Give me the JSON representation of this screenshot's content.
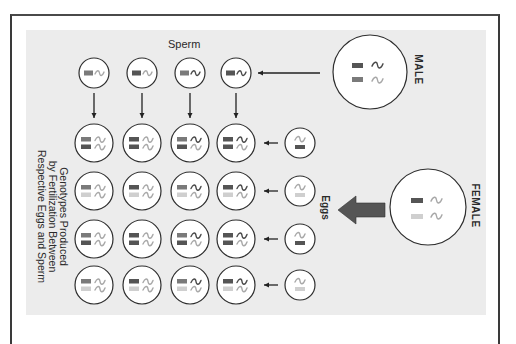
{
  "labels": {
    "sperm": "Sperm",
    "male": "MALE",
    "female": "FEMALE",
    "eggs": "Eggs",
    "genotypes_line1": "Genotypes Produced",
    "genotypes_line2": "by Fertilization Between",
    "genotypes_line3": "Respective Eggs and Sperm"
  },
  "colors": {
    "dark_bar": "#555555",
    "mid_bar": "#7a7a7a",
    "light_bar": "#cfcfcf",
    "dark_squiggle": "#4a4a4a",
    "light_squiggle": "#a8a8a8",
    "panel_bg": "#ececec",
    "arrow_fill": "#555555"
  },
  "male": {
    "bars": [
      "dark",
      "mid"
    ],
    "squiggles": [
      "dark",
      "light"
    ]
  },
  "female": {
    "bars": [
      "dark",
      "light"
    ],
    "squiggles": [
      "light",
      "light"
    ]
  },
  "sperm": [
    {
      "bar": "mid",
      "squiggle": "light"
    },
    {
      "bar": "dark",
      "squiggle": "light"
    },
    {
      "bar": "mid",
      "squiggle": "dark"
    },
    {
      "bar": "dark",
      "squiggle": "dark"
    }
  ],
  "eggs": [
    {
      "bar": "dark",
      "squiggle": "light"
    },
    {
      "bar": "light",
      "squiggle": "light"
    },
    {
      "bar": "dark",
      "squiggle": "light"
    },
    {
      "bar": "light",
      "squiggle": "light"
    }
  ]
}
